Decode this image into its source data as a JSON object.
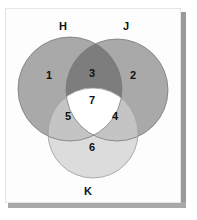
{
  "diagram": {
    "type": "venn",
    "sets": [
      {
        "name": "H",
        "label": "H",
        "cx": 70,
        "cy": 89,
        "r": 52
      },
      {
        "name": "J",
        "label": "J",
        "cx": 117,
        "cy": 90,
        "r": 51
      },
      {
        "name": "K",
        "label": "K",
        "cx": 93,
        "cy": 133,
        "r": 45
      }
    ],
    "regions": [
      {
        "id": "1",
        "label": "1",
        "sets": [
          "H"
        ]
      },
      {
        "id": "2",
        "label": "2",
        "sets": [
          "J"
        ]
      },
      {
        "id": "3",
        "label": "3",
        "sets": [
          "H",
          "J"
        ]
      },
      {
        "id": "4",
        "label": "4",
        "sets": [
          "J",
          "K"
        ]
      },
      {
        "id": "5",
        "label": "5",
        "sets": [
          "H",
          "K"
        ]
      },
      {
        "id": "6",
        "label": "6",
        "sets": [
          "K"
        ]
      },
      {
        "id": "7",
        "label": "7",
        "sets": [
          "H",
          "J",
          "K"
        ]
      }
    ],
    "colors": {
      "single_hj": "#a9a9a9",
      "overlap_hj": "#7d7d7d",
      "single_k": "#dcdcdc",
      "overlap_k": "#c4c4c4",
      "center": "#ffffff",
      "stroke": "#777777"
    }
  }
}
